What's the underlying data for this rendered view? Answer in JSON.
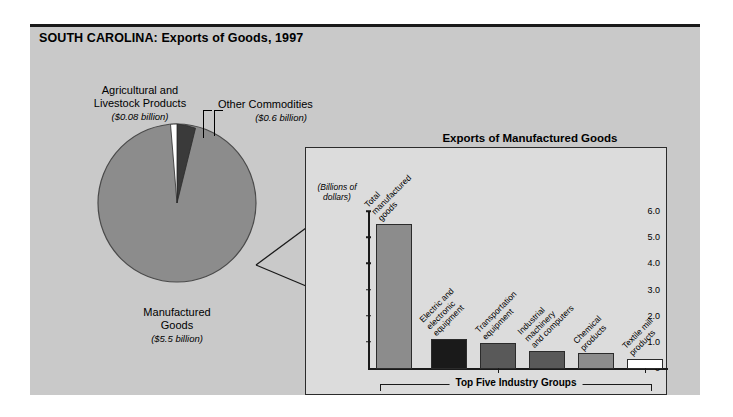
{
  "page": {
    "title": "SOUTH CAROLINA: Exports of Goods, 1997",
    "background_color": "#c9c9c9",
    "panel_color": "#dcdcdc"
  },
  "pie": {
    "labels": {
      "agricultural": {
        "name": "Agricultural and Livestock Products",
        "line1": "Agricultural and",
        "line2": "Livestock Products",
        "amount": "($0.08 billion)"
      },
      "other": {
        "name": "Other Commodities",
        "line1": "Other Commodities",
        "amount": "($0.6 billion)"
      },
      "manufactured": {
        "name": "Manufactured Goods",
        "line1": "Manufactured",
        "line2": "Goods",
        "amount": "($5.5 billion)"
      }
    }
  },
  "bar_panel": {
    "title": "Exports of Manufactured Goods",
    "axis_caption_line1": "(Billions of",
    "axis_caption_line2": "dollars)",
    "bracket_label": "Top Five Industry Groups"
  },
  "chart_data": [
    {
      "type": "pie",
      "title": "SOUTH CAROLINA: Exports of Goods, 1997",
      "unit": "billions of dollars",
      "labels": [
        "Manufactured Goods",
        "Other Commodities",
        "Agricultural and Livestock Products"
      ],
      "values": [
        5.5,
        0.6,
        0.08
      ],
      "value_labels": [
        "($5.5 billion)",
        "($0.6 billion)",
        "($0.08 billion)"
      ],
      "colors": [
        "#8c8c8c",
        "#3a3a3a",
        "#ffffff"
      ],
      "legend": "labels with leader lines",
      "start_angle_deg": -90,
      "direction": "counterclockwise"
    },
    {
      "type": "bar",
      "title": "Exports of Manufactured Goods",
      "xlabel": "",
      "ylabel": "(Billions of dollars)",
      "ylim": [
        0,
        6.0
      ],
      "yticks": [
        "0",
        "1.0",
        "2.0",
        "3.0",
        "4.0",
        "5.0",
        "6.0"
      ],
      "ytick_values": [
        0,
        1.0,
        2.0,
        3.0,
        4.0,
        5.0,
        6.0
      ],
      "grid": false,
      "categories": [
        "Total manufactured goods",
        "Electric and electronic equipment",
        "Transportation equipment",
        "Industrial machinery and computers",
        "Chemical products",
        "Textile mill products"
      ],
      "category_lines": [
        [
          "Total",
          "manufactured",
          "goods"
        ],
        [
          "Electric and",
          "electronic",
          "equipment"
        ],
        [
          "Transportation",
          "equipment"
        ],
        [
          "Industrial",
          "machinery",
          "and computers"
        ],
        [
          "Chemical",
          "products"
        ],
        [
          "Textile mill",
          "products"
        ]
      ],
      "values": [
        5.55,
        1.15,
        1.0,
        0.7,
        0.6,
        0.4
      ],
      "colors": [
        "#8c8c8c",
        "#1a1a1a",
        "#595959",
        "#595959",
        "#8c8c8c",
        "#ffffff"
      ],
      "annotation": "Top Five Industry Groups"
    }
  ]
}
